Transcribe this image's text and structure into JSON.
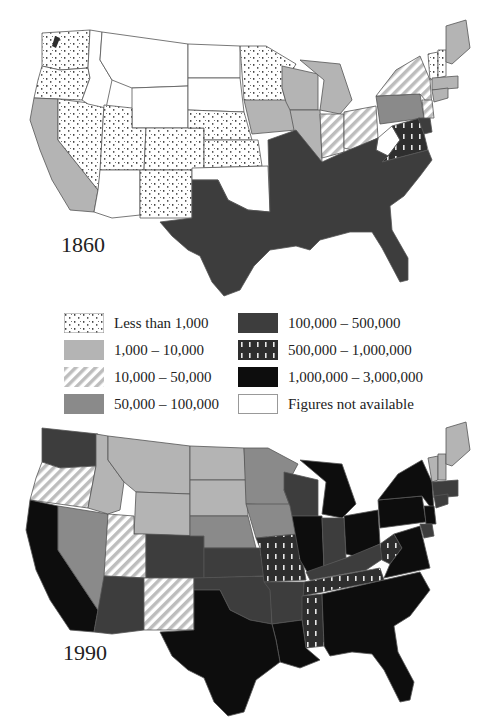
{
  "figure": {
    "maps": [
      {
        "id": "map-1860",
        "year_label": "1860"
      },
      {
        "id": "map-1990",
        "year_label": "1990"
      }
    ]
  },
  "legend": {
    "items": [
      {
        "label": "Less than 1,000",
        "pattern": "dotted",
        "fill": "#ffffff"
      },
      {
        "label": "1,000 – 10,000",
        "pattern": "solid",
        "fill": "#b4b4b4"
      },
      {
        "label": "10,000 – 50,000",
        "pattern": "hatched",
        "fill": "#c8c8c8"
      },
      {
        "label": "50,000 – 100,000",
        "pattern": "solid",
        "fill": "#8a8a8a"
      },
      {
        "label": "100,000 – 500,000",
        "pattern": "solid",
        "fill": "#3d3d3d"
      },
      {
        "label": "500,000 – 1,000,000",
        "pattern": "dashes",
        "fill": "#2e2e2e"
      },
      {
        "label": "1,000,000 – 3,000,000",
        "pattern": "solid",
        "fill": "#0d0d0d"
      },
      {
        "label": "Figures not available",
        "pattern": "none",
        "fill": "#ffffff"
      }
    ]
  },
  "colors": {
    "less_1k": "#ffffff",
    "k1_10k": "#b4b4b4",
    "k10_50k": "#c8c8c8",
    "k50_100k": "#8a8a8a",
    "k100_500k": "#3d3d3d",
    "k500k_1m": "#2e2e2e",
    "m1_3m": "#0d0d0d",
    "na": "#ffffff",
    "border": "#555555"
  }
}
